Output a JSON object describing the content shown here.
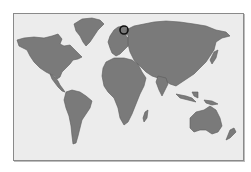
{
  "map": {
    "type": "world-map",
    "style": "grayscale",
    "colors": {
      "background": "#ffffff",
      "ocean": "#ececec",
      "land": "#7a7a7a",
      "border": "#8a8a8a",
      "marker": "#111111"
    },
    "regions": [
      "North America",
      "Greenland",
      "South America",
      "Europe",
      "Africa",
      "Asia",
      "Australia",
      "New Zealand",
      "Madagascar",
      "Japan",
      "Indonesia"
    ],
    "marker": {
      "icon": "circle-marker-icon",
      "location": "Scandinavia"
    }
  }
}
